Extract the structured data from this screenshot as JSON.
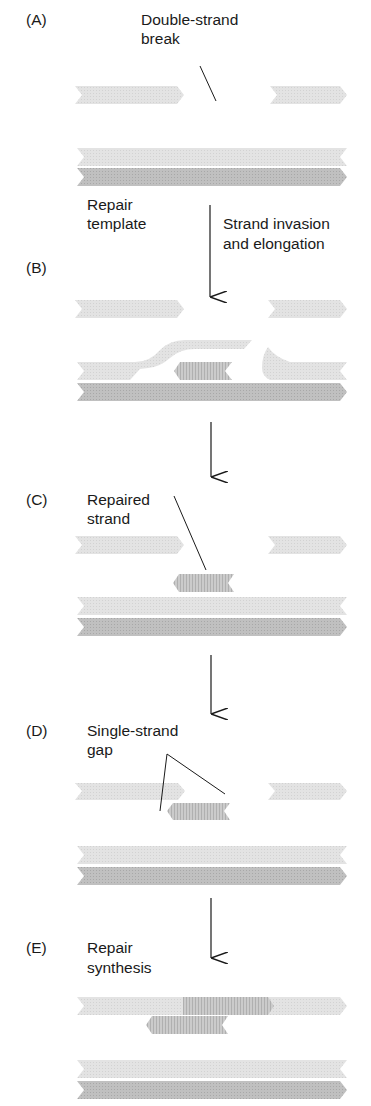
{
  "colors": {
    "broken_strand": "#e2e2e2",
    "template_light": "#e0e0e0",
    "template_dark": "#bcbcbc",
    "new_synthesis": "#c6c6c6",
    "line": "#1a1a1a"
  },
  "panels": [
    {
      "id": "A",
      "label": "(A)",
      "annotation": "Double-strand\nbreak",
      "annotation_lines": [
        "Double-strand",
        "break"
      ]
    },
    {
      "id": "B",
      "label": "(B)"
    },
    {
      "id": "C",
      "label": "(C)",
      "annotation_lines": [
        "Repaired",
        "strand"
      ]
    },
    {
      "id": "D",
      "label": "(D)",
      "annotation_lines": [
        "Single-strand",
        "gap"
      ]
    },
    {
      "id": "E",
      "label": "(E)",
      "annotation_lines": [
        "Repair",
        "synthesis"
      ]
    }
  ],
  "side_labels": {
    "repair_template": [
      "Repair",
      "template"
    ],
    "step_ab": [
      "Strand invasion",
      "and elongation"
    ]
  }
}
